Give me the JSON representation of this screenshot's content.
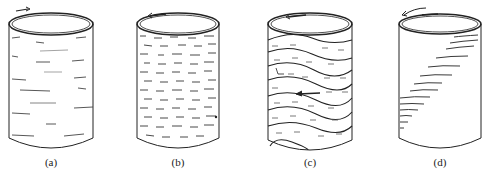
{
  "figure": {
    "background": "#ffffff",
    "stroke_color": "#222222",
    "panels": [
      {
        "id": "a",
        "label": "(a)",
        "description": "cylinder with sparse short horizontal dashes, rotation arrow on top rim"
      },
      {
        "id": "b",
        "label": "(b)",
        "description": "cylinder densely covered with short horizontal dashes, rotation arrow on top rim"
      },
      {
        "id": "c",
        "label": "(c)",
        "description": "cylinder with wavy helical bands and dashes, rotation arrow on rim and arrow in middle"
      },
      {
        "id": "d",
        "label": "(d)",
        "description": "cylinder with diagonal staircase of wavy horizontal lines from upper right to lower left, rotation arrow on top"
      }
    ]
  }
}
